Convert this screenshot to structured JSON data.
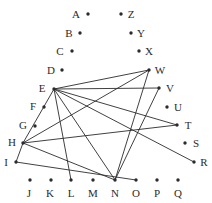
{
  "figure": {
    "background_color": "#ffffff",
    "ink_color": "#2b2b2b",
    "width": 212,
    "height": 203
  },
  "chart_data": {
    "type": "scatter",
    "title": "",
    "xlabel": "",
    "ylabel": "",
    "grid": false,
    "legend": "none",
    "xlim": [
      0,
      212
    ],
    "ylim": [
      0,
      203
    ],
    "note": "Vertices are dots with adjacent single-letter labels; edges are straight line segments.",
    "nodes": [
      {
        "id": "A",
        "label": "A",
        "x": 88,
        "y": 14,
        "label_x": 76,
        "label_y": 14
      },
      {
        "id": "B",
        "label": "B",
        "x": 80,
        "y": 33,
        "label_x": 69,
        "label_y": 33
      },
      {
        "id": "C",
        "label": "C",
        "x": 72,
        "y": 51,
        "label_x": 60,
        "label_y": 51
      },
      {
        "id": "D",
        "label": "D",
        "x": 62,
        "y": 70,
        "label_x": 51,
        "label_y": 70
      },
      {
        "id": "E",
        "label": "E",
        "x": 54,
        "y": 89,
        "label_x": 42,
        "label_y": 88
      },
      {
        "id": "F",
        "label": "F",
        "x": 44,
        "y": 107,
        "label_x": 33,
        "label_y": 106
      },
      {
        "id": "G",
        "label": "G",
        "x": 35,
        "y": 126,
        "label_x": 23,
        "label_y": 125
      },
      {
        "id": "H",
        "label": "H",
        "x": 23,
        "y": 143,
        "label_x": 12,
        "label_y": 142
      },
      {
        "id": "I",
        "label": "I",
        "x": 16,
        "y": 162,
        "label_x": 6,
        "label_y": 162
      },
      {
        "id": "J",
        "label": "J",
        "x": 30,
        "y": 180,
        "label_x": 29,
        "label_y": 193
      },
      {
        "id": "K",
        "label": "K",
        "x": 51,
        "y": 180,
        "label_x": 50,
        "label_y": 193
      },
      {
        "id": "L",
        "label": "L",
        "x": 71,
        "y": 180,
        "label_x": 71,
        "label_y": 193
      },
      {
        "id": "M",
        "label": "M",
        "x": 93,
        "y": 180,
        "label_x": 93,
        "label_y": 193
      },
      {
        "id": "N",
        "label": "N",
        "x": 115,
        "y": 180,
        "label_x": 115,
        "label_y": 193
      },
      {
        "id": "O",
        "label": "O",
        "x": 136,
        "y": 180,
        "label_x": 136,
        "label_y": 193
      },
      {
        "id": "P",
        "label": "P",
        "x": 157,
        "y": 180,
        "label_x": 157,
        "label_y": 193
      },
      {
        "id": "Q",
        "label": "Q",
        "x": 178,
        "y": 180,
        "label_x": 178,
        "label_y": 193
      },
      {
        "id": "R",
        "label": "R",
        "x": 194,
        "y": 162,
        "label_x": 204,
        "label_y": 162
      },
      {
        "id": "S",
        "label": "S",
        "x": 185,
        "y": 143,
        "label_x": 196,
        "label_y": 143
      },
      {
        "id": "T",
        "label": "T",
        "x": 177,
        "y": 125,
        "label_x": 188,
        "label_y": 125
      },
      {
        "id": "U",
        "label": "U",
        "x": 167,
        "y": 107,
        "label_x": 178,
        "label_y": 107
      },
      {
        "id": "V",
        "label": "V",
        "x": 159,
        "y": 88,
        "label_x": 170,
        "label_y": 88
      },
      {
        "id": "W",
        "label": "W",
        "x": 149,
        "y": 70,
        "label_x": 160,
        "label_y": 70
      },
      {
        "id": "X",
        "label": "X",
        "x": 139,
        "y": 51,
        "label_x": 149,
        "label_y": 51
      },
      {
        "id": "Y",
        "label": "Y",
        "x": 131,
        "y": 33,
        "label_x": 141,
        "label_y": 33
      },
      {
        "id": "Z",
        "label": "Z",
        "x": 121,
        "y": 14,
        "label_x": 131,
        "label_y": 14
      }
    ],
    "edges": [
      {
        "from": "E",
        "to": "W"
      },
      {
        "from": "E",
        "to": "V"
      },
      {
        "from": "E",
        "to": "T"
      },
      {
        "from": "E",
        "to": "N"
      },
      {
        "from": "E",
        "to": "L"
      },
      {
        "from": "E",
        "to": "H"
      },
      {
        "from": "E",
        "to": "R"
      },
      {
        "from": "H",
        "to": "W"
      },
      {
        "from": "H",
        "to": "T"
      },
      {
        "from": "H",
        "to": "I"
      },
      {
        "from": "H",
        "to": "N"
      },
      {
        "from": "I",
        "to": "O"
      },
      {
        "from": "N",
        "to": "V"
      },
      {
        "from": "N",
        "to": "W"
      }
    ],
    "isolated_nodes": [
      "A",
      "B",
      "C",
      "D",
      "F",
      "G",
      "J",
      "K",
      "M",
      "P",
      "Q",
      "S",
      "U",
      "X",
      "Y",
      "Z"
    ]
  }
}
